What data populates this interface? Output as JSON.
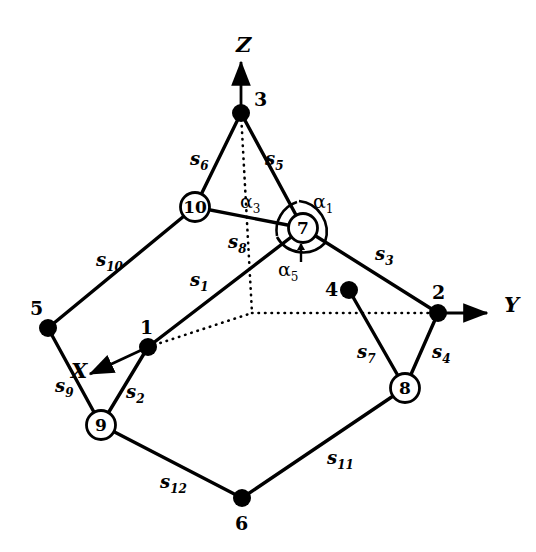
{
  "figure": {
    "type": "3d-truss-diagram",
    "width": 536,
    "height": 552,
    "background": "#ffffff",
    "ink_color": "#000000"
  },
  "axes": [
    {
      "name": "z-axis",
      "label": "Z",
      "label_x": 236,
      "label_y": 32,
      "from": [
        241,
        113
      ],
      "to": [
        241,
        62
      ],
      "style": "solid-arrow"
    },
    {
      "name": "y-axis",
      "label": "Y",
      "label_x": 504,
      "label_y": 292,
      "from": [
        438,
        313
      ],
      "to": [
        487,
        313
      ],
      "style": "solid-arrow"
    },
    {
      "name": "x-axis",
      "label": "X",
      "label_x": 71,
      "label_y": 358,
      "from": [
        148,
        347
      ],
      "to": [
        90,
        374
      ],
      "style": "solid-arrow"
    }
  ],
  "nodes": [
    {
      "id": "1",
      "label": "1",
      "x": 148,
      "y": 347,
      "marker": "filled",
      "label_x": 140,
      "label_y": 316
    },
    {
      "id": "2",
      "label": "2",
      "x": 438,
      "y": 313,
      "marker": "filled",
      "label_x": 432,
      "label_y": 281
    },
    {
      "id": "3",
      "label": "3",
      "x": 241,
      "y": 113,
      "marker": "filled",
      "label_x": 254,
      "label_y": 88
    },
    {
      "id": "4",
      "label": "4",
      "x": 349,
      "y": 290,
      "marker": "filled",
      "label_x": 325,
      "label_y": 278
    },
    {
      "id": "5",
      "label": "5",
      "x": 48,
      "y": 328,
      "marker": "filled",
      "label_x": 30,
      "label_y": 297
    },
    {
      "id": "6",
      "label": "6",
      "x": 242,
      "y": 498,
      "marker": "filled",
      "label_x": 235,
      "label_y": 512
    },
    {
      "id": "7",
      "label": "7",
      "x": 303,
      "y": 228,
      "marker": "circled",
      "label_x": 296,
      "label_y": 217
    },
    {
      "id": "8",
      "label": "8",
      "x": 405,
      "y": 388,
      "marker": "circled",
      "label_x": 398,
      "label_y": 377
    },
    {
      "id": "9",
      "label": "9",
      "x": 101,
      "y": 425,
      "marker": "circled",
      "label_x": 94,
      "label_y": 414
    },
    {
      "id": "10",
      "label": "10",
      "x": 195,
      "y": 207,
      "marker": "circled",
      "label_x": 186,
      "label_y": 196
    }
  ],
  "members": [
    {
      "name": "s1",
      "label": "s",
      "sub": "1",
      "from": "1",
      "to": "7",
      "label_x": 190,
      "label_y": 269
    },
    {
      "name": "s2",
      "label": "s",
      "sub": "2",
      "from": "1",
      "to": "9",
      "label_x": 126,
      "label_y": 381
    },
    {
      "name": "s3",
      "label": "s",
      "sub": "3",
      "from": "7",
      "to": "2",
      "label_x": 375,
      "label_y": 243
    },
    {
      "name": "s4",
      "label": "s",
      "sub": "4",
      "from": "2",
      "to": "8",
      "label_x": 432,
      "label_y": 341
    },
    {
      "name": "s5",
      "label": "s",
      "sub": "5",
      "from": "3",
      "to": "7",
      "label_x": 265,
      "label_y": 148
    },
    {
      "name": "s6",
      "label": "s",
      "sub": "6",
      "from": "3",
      "to": "10",
      "label_x": 190,
      "label_y": 148
    },
    {
      "name": "s7",
      "label": "s",
      "sub": "7",
      "from": "4",
      "to": "8",
      "label_x": 357,
      "label_y": 341
    },
    {
      "name": "s8",
      "label": "s",
      "sub": "8",
      "from": "10",
      "to": "7",
      "label_x": 228,
      "label_y": 231
    },
    {
      "name": "s9",
      "label": "s",
      "sub": "9",
      "from": "5",
      "to": "9",
      "label_x": 55,
      "label_y": 375
    },
    {
      "name": "s10",
      "label": "s",
      "sub": "10",
      "from": "5",
      "to": "10",
      "label_x": 96,
      "label_y": 249
    },
    {
      "name": "s11",
      "label": "s",
      "sub": "11",
      "from": "6",
      "to": "8",
      "label_x": 327,
      "label_y": 447
    },
    {
      "name": "s12",
      "label": "s",
      "sub": "12",
      "from": "9",
      "to": "6",
      "label_x": 160,
      "label_y": 471
    }
  ],
  "angles": [
    {
      "name": "alpha1",
      "label": "α",
      "sub": "1",
      "label_x": 313,
      "label_y": 190
    },
    {
      "name": "alpha3",
      "label": "α",
      "sub": "3",
      "label_x": 240,
      "label_y": 190
    },
    {
      "name": "alpha5",
      "label": "α",
      "sub": "5",
      "label_x": 278,
      "label_y": 258
    }
  ],
  "hidden_lines": [
    {
      "name": "hidden-3-origin",
      "from": [
        241,
        113
      ],
      "to": [
        252,
        313
      ]
    },
    {
      "name": "hidden-1-origin",
      "from": [
        148,
        347
      ],
      "to": [
        252,
        313
      ]
    },
    {
      "name": "hidden-origin-2",
      "from": [
        252,
        313
      ],
      "to": [
        438,
        313
      ]
    }
  ]
}
